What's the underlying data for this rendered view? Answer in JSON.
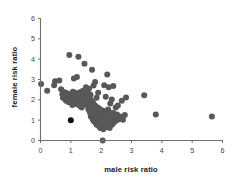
{
  "chart_data": {
    "type": "scatter",
    "title": "",
    "xlabel": "male risk ratio",
    "ylabel": "female risk ratio",
    "xlim": [
      0,
      6
    ],
    "ylim": [
      0,
      6
    ],
    "xticks": [
      0,
      1,
      2,
      3,
      4,
      5,
      6
    ],
    "yticks": [
      0,
      1,
      2,
      3,
      4,
      5,
      6
    ],
    "xtick_labels": [
      "0",
      "1",
      "2",
      "3",
      "4",
      "5",
      "6"
    ],
    "ytick_labels": [
      "0",
      "1",
      "2",
      "3",
      "4",
      "5",
      "6"
    ],
    "grid": false,
    "legend": null,
    "marker_color": "#585858",
    "highlight_marker_color": "#111111",
    "marker_size": 3.0,
    "n_points": 178,
    "points": [
      [
        0.02,
        2.78
      ],
      [
        0.22,
        2.45
      ],
      [
        0.45,
        2.72
      ],
      [
        0.48,
        2.92
      ],
      [
        0.62,
        2.95
      ],
      [
        0.68,
        2.52
      ],
      [
        0.72,
        2.28
      ],
      [
        0.74,
        2.1
      ],
      [
        0.78,
        2.38
      ],
      [
        0.8,
        2.05
      ],
      [
        0.82,
        2.22
      ],
      [
        0.84,
        1.95
      ],
      [
        0.86,
        2.15
      ],
      [
        0.88,
        2.32
      ],
      [
        0.9,
        2.02
      ],
      [
        0.92,
        2.18
      ],
      [
        0.93,
        1.88
      ],
      [
        0.95,
        4.2
      ],
      [
        0.96,
        2.25
      ],
      [
        0.98,
        2.08
      ],
      [
        1.0,
        1.0
      ],
      [
        1.0,
        2.12
      ],
      [
        1.02,
        2.3
      ],
      [
        1.03,
        1.92
      ],
      [
        1.04,
        2.2
      ],
      [
        1.05,
        1.75
      ],
      [
        1.06,
        2.05
      ],
      [
        1.07,
        2.4
      ],
      [
        1.08,
        1.98
      ],
      [
        1.09,
        2.15
      ],
      [
        1.1,
        3.05
      ],
      [
        1.1,
        2.26
      ],
      [
        1.12,
        1.82
      ],
      [
        1.13,
        2.1
      ],
      [
        1.14,
        2.35
      ],
      [
        1.15,
        2.0
      ],
      [
        1.16,
        2.18
      ],
      [
        1.17,
        1.9
      ],
      [
        1.18,
        2.28
      ],
      [
        1.19,
        2.06
      ],
      [
        1.2,
        3.12
      ],
      [
        1.2,
        2.14
      ],
      [
        1.21,
        1.78
      ],
      [
        1.22,
        2.22
      ],
      [
        1.23,
        1.96
      ],
      [
        1.24,
        2.08
      ],
      [
        1.25,
        4.12
      ],
      [
        1.25,
        2.32
      ],
      [
        1.26,
        1.85
      ],
      [
        1.27,
        2.16
      ],
      [
        1.28,
        2.02
      ],
      [
        1.29,
        2.26
      ],
      [
        1.3,
        1.7
      ],
      [
        1.31,
        2.1
      ],
      [
        1.32,
        2.38
      ],
      [
        1.33,
        1.93
      ],
      [
        1.34,
        2.2
      ],
      [
        1.35,
        2.05
      ],
      [
        1.36,
        1.62
      ],
      [
        1.38,
        2.12
      ],
      [
        1.4,
        2.45
      ],
      [
        1.4,
        1.8
      ],
      [
        1.42,
        2.0
      ],
      [
        1.44,
        2.22
      ],
      [
        1.45,
        3.78
      ],
      [
        1.46,
        1.88
      ],
      [
        1.48,
        2.08
      ],
      [
        1.5,
        2.62
      ],
      [
        1.5,
        1.95
      ],
      [
        1.52,
        2.15
      ],
      [
        1.54,
        1.72
      ],
      [
        1.55,
        2.4
      ],
      [
        1.56,
        2.02
      ],
      [
        1.58,
        1.52
      ],
      [
        1.6,
        2.55
      ],
      [
        1.6,
        1.85
      ],
      [
        1.62,
        2.1
      ],
      [
        1.63,
        1.38
      ],
      [
        1.64,
        1.65
      ],
      [
        1.65,
        2.25
      ],
      [
        1.66,
        1.18
      ],
      [
        1.68,
        1.45
      ],
      [
        1.69,
        1.95
      ],
      [
        1.7,
        3.48
      ],
      [
        1.7,
        1.3
      ],
      [
        1.71,
        1.6
      ],
      [
        1.72,
        1.05
      ],
      [
        1.73,
        1.42
      ],
      [
        1.74,
        1.85
      ],
      [
        1.75,
        2.7
      ],
      [
        1.75,
        1.22
      ],
      [
        1.76,
        0.95
      ],
      [
        1.77,
        1.52
      ],
      [
        1.78,
        1.12
      ],
      [
        1.79,
        1.35
      ],
      [
        1.8,
        2.88
      ],
      [
        1.8,
        1.72
      ],
      [
        1.81,
        0.88
      ],
      [
        1.82,
        1.28
      ],
      [
        1.83,
        1.05
      ],
      [
        1.84,
        1.48
      ],
      [
        1.85,
        2.1
      ],
      [
        1.85,
        0.78
      ],
      [
        1.86,
        1.18
      ],
      [
        1.87,
        0.95
      ],
      [
        1.88,
        1.38
      ],
      [
        1.89,
        1.62
      ],
      [
        1.9,
        2.35
      ],
      [
        1.9,
        0.85
      ],
      [
        1.91,
        1.1
      ],
      [
        1.92,
        1.3
      ],
      [
        1.93,
        0.7
      ],
      [
        1.94,
        1.02
      ],
      [
        1.95,
        1.55
      ],
      [
        1.95,
        0.92
      ],
      [
        1.96,
        1.22
      ],
      [
        1.97,
        0.62
      ],
      [
        1.98,
        1.08
      ],
      [
        1.99,
        1.42
      ],
      [
        2.0,
        0.82
      ],
      [
        2.0,
        1.15
      ],
      [
        2.01,
        0.98
      ],
      [
        2.02,
        1.32
      ],
      [
        2.03,
        0.72
      ],
      [
        2.04,
        1.05
      ],
      [
        2.05,
        0.0
      ],
      [
        2.05,
        1.48
      ],
      [
        2.05,
        0.88
      ],
      [
        2.06,
        1.2
      ],
      [
        2.07,
        0.55
      ],
      [
        2.08,
        1.0
      ],
      [
        2.09,
        1.35
      ],
      [
        2.1,
        2.72
      ],
      [
        2.1,
        0.78
      ],
      [
        2.11,
        1.12
      ],
      [
        2.12,
        0.92
      ],
      [
        2.13,
        1.28
      ],
      [
        2.14,
        0.65
      ],
      [
        2.15,
        2.15
      ],
      [
        2.15,
        1.05
      ],
      [
        2.16,
        1.42
      ],
      [
        2.17,
        0.85
      ],
      [
        2.18,
        1.18
      ],
      [
        2.19,
        0.95
      ],
      [
        2.2,
        3.25
      ],
      [
        2.2,
        1.32
      ],
      [
        2.21,
        0.72
      ],
      [
        2.22,
        1.08
      ],
      [
        2.23,
        1.52
      ],
      [
        2.24,
        0.88
      ],
      [
        2.25,
        2.62
      ],
      [
        2.25,
        1.22
      ],
      [
        2.26,
        0.98
      ],
      [
        2.27,
        1.38
      ],
      [
        2.28,
        0.62
      ],
      [
        2.3,
        1.82
      ],
      [
        2.3,
        1.12
      ],
      [
        2.32,
        0.92
      ],
      [
        2.34,
        1.25
      ],
      [
        2.35,
        2.02
      ],
      [
        2.36,
        0.78
      ],
      [
        2.38,
        1.05
      ],
      [
        2.4,
        2.68
      ],
      [
        2.4,
        1.35
      ],
      [
        2.42,
        0.88
      ],
      [
        2.45,
        1.15
      ],
      [
        2.48,
        1.62
      ],
      [
        2.5,
        0.98
      ],
      [
        2.52,
        1.28
      ],
      [
        2.55,
        1.72
      ],
      [
        2.58,
        1.05
      ],
      [
        2.62,
        1.18
      ],
      [
        2.68,
        1.95
      ],
      [
        2.72,
        1.02
      ],
      [
        2.78,
        1.25
      ],
      [
        2.82,
        2.12
      ],
      [
        3.42,
        2.22
      ],
      [
        3.8,
        1.28
      ],
      [
        5.65,
        1.18
      ]
    ],
    "highlight_points": [
      [
        1.0,
        1.0
      ]
    ]
  }
}
